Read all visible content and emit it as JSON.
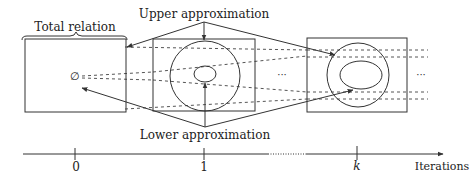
{
  "diagram": {
    "labels": {
      "total_relation": "Total relation",
      "upper_approximation": "Upper approximation",
      "lower_approximation": "Lower approximation",
      "empty_set": "∅",
      "ellipsis_middle": "···",
      "ellipsis_right": "···"
    },
    "axis": {
      "label": "Iterations",
      "ticks": [
        "0",
        "1",
        "k"
      ]
    },
    "stages": [
      {
        "iteration": "0",
        "content": "Total relation box with empty-set lower approximation"
      },
      {
        "iteration": "1",
        "content": "Box with upper approximation circle and lower approximation ellipse"
      },
      {
        "iteration": "k",
        "content": "Box with converging upper and lower approximation ellipses"
      }
    ],
    "colors": {
      "stroke": "#333333",
      "text": "#222222",
      "background": "#ffffff"
    }
  }
}
